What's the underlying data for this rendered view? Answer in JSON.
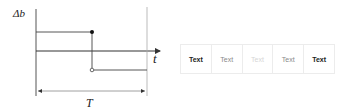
{
  "diagram": {
    "y_axis_label": "Δb",
    "x_axis_label": "t",
    "period_label": "T",
    "colors": {
      "line": "#333333",
      "guide": "#aaaaaa"
    }
  },
  "segmented_control": {
    "items": [
      {
        "label": "Text",
        "color": "#222222",
        "weight": "bold"
      },
      {
        "label": "Text",
        "color": "#8a8a8a",
        "weight": "normal"
      },
      {
        "label": "Text",
        "color": "#d6d6d6",
        "weight": "normal"
      },
      {
        "label": "Text",
        "color": "#8a8a8a",
        "weight": "normal"
      },
      {
        "label": "Text",
        "color": "#222222",
        "weight": "bold"
      }
    ],
    "border_color": "#ececec"
  }
}
